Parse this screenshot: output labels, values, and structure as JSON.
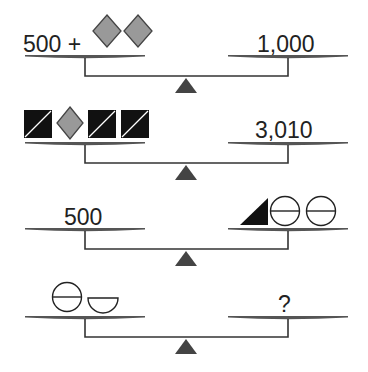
{
  "colors": {
    "pan": "#555555",
    "line": "#333333",
    "fulcrum": "#444444",
    "diamond_fill": "#999999",
    "diamond_stroke": "#444444",
    "square_fill": "#111111",
    "text": "#222222"
  },
  "scales": [
    {
      "left": {
        "text": "500 +",
        "shapes": [
          "diamond",
          "diamond"
        ]
      },
      "right": {
        "text": "1,000",
        "shapes": []
      }
    },
    {
      "left": {
        "text": "",
        "shapes": [
          "split-square",
          "diamond",
          "split-square",
          "split-square"
        ]
      },
      "right": {
        "text": "3,010",
        "shapes": []
      }
    },
    {
      "left": {
        "text": "500",
        "shapes": []
      },
      "right": {
        "text": "",
        "shapes": [
          "black-triangle",
          "split-circle",
          "split-circle"
        ]
      }
    },
    {
      "left": {
        "text": "",
        "shapes": [
          "split-circle",
          "half-circle"
        ]
      },
      "right": {
        "text": "?",
        "shapes": []
      }
    }
  ]
}
